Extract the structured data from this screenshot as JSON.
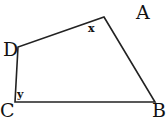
{
  "diagram": {
    "shape": "quadrilateral",
    "vertices": {
      "A": {
        "label": "A"
      },
      "B": {
        "label": "B"
      },
      "C": {
        "label": "C"
      },
      "D": {
        "label": "D"
      }
    },
    "angles": {
      "x": {
        "label": "x",
        "at": "A"
      },
      "y": {
        "label": "y",
        "at": "C"
      }
    },
    "stroke_color": "#222222"
  }
}
